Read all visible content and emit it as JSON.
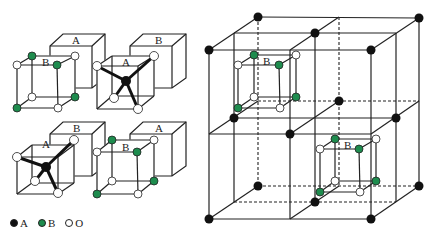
{
  "figure": {
    "colors": {
      "A": "#111111",
      "B": "#1e8c4e",
      "O": "#ffffff",
      "line": "#222222"
    },
    "left_panel": {
      "units": [
        {
          "back_label": "A",
          "front_label": "B",
          "type": "B-site cube (green B + white O)"
        },
        {
          "back_label": "B",
          "front_label": "A",
          "type": "A-site tetrahedron (black A + white O)"
        },
        {
          "back_label": "B",
          "front_label": "A",
          "type": "A-site tetrahedron (black A + white O)"
        },
        {
          "back_label": "A",
          "front_label": "B",
          "type": "B-site cube (green B + white O)"
        }
      ]
    },
    "right_panel": {
      "description": "2x2x2 lattice with black A atoms at corners and centers, containing B-labelled subcubes",
      "subcube_labels": [
        "B",
        "B"
      ]
    },
    "legend": [
      {
        "symbol": "filled-black-circle",
        "label": "A"
      },
      {
        "symbol": "filled-green-circle",
        "label": "B"
      },
      {
        "symbol": "open-circle",
        "label": "O"
      }
    ]
  }
}
